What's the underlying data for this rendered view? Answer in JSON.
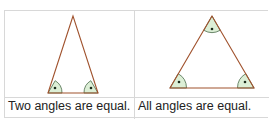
{
  "cells": [
    {
      "caption": "Two angles are equal.",
      "shape": "isosceles-triangle"
    },
    {
      "caption": "All angles are equal.",
      "shape": "equilateral-triangle"
    }
  ],
  "colors": {
    "stroke": "#a0522d",
    "angle_fill": "#dcefd6",
    "angle_stroke": "#4a6b4a",
    "dot": "#1a2a1a",
    "border": "#d8d8d8"
  }
}
